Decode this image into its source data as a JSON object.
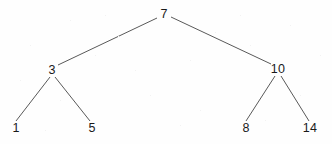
{
  "diagram": {
    "type": "tree",
    "background_color": "#fefefe",
    "edge_color": "#595959",
    "label_color": "#1a1a1a",
    "nodes": [
      {
        "id": "root",
        "label": "7",
        "x": 164,
        "y": 14,
        "level": 0
      },
      {
        "id": "n3",
        "label": "3",
        "x": 52,
        "y": 70,
        "level": 1
      },
      {
        "id": "n10",
        "label": "10",
        "x": 278,
        "y": 69,
        "level": 1
      },
      {
        "id": "n1",
        "label": "1",
        "x": 16,
        "y": 128,
        "level": 2
      },
      {
        "id": "n5",
        "label": "5",
        "x": 92,
        "y": 128,
        "level": 2
      },
      {
        "id": "n8",
        "label": "8",
        "x": 246,
        "y": 128,
        "level": 2
      },
      {
        "id": "n14",
        "label": "14",
        "x": 310,
        "y": 128,
        "level": 2
      }
    ],
    "edges": [
      {
        "id": "e-root-n3",
        "from": "root",
        "to": "n3",
        "x1": 157,
        "y1": 18,
        "x2": 58,
        "y2": 65
      },
      {
        "id": "e-root-n10",
        "from": "root",
        "to": "n10",
        "x1": 171,
        "y1": 17,
        "x2": 271,
        "y2": 64
      },
      {
        "id": "e-n3-n1",
        "from": "n3",
        "to": "n1",
        "x1": 50,
        "y1": 77,
        "x2": 16,
        "y2": 121
      },
      {
        "id": "e-n3-n5",
        "from": "n3",
        "to": "n5",
        "x1": 55,
        "y1": 77,
        "x2": 90,
        "y2": 121
      },
      {
        "id": "e-n10-n8",
        "from": "n10",
        "to": "n8",
        "x1": 275,
        "y1": 76,
        "x2": 246,
        "y2": 121
      },
      {
        "id": "e-n10-n14",
        "from": "n10",
        "to": "n14",
        "x1": 281,
        "y1": 76,
        "x2": 309,
        "y2": 121
      }
    ]
  }
}
